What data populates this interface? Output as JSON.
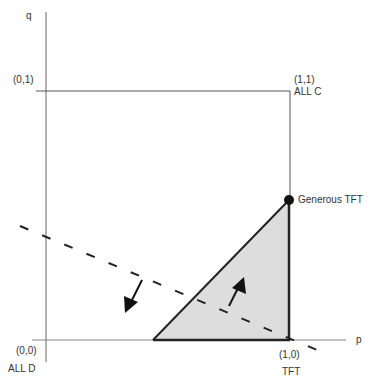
{
  "diagram": {
    "axes": {
      "x_label": "p",
      "y_label": "q"
    },
    "corners": {
      "origin": {
        "coord": "(0,0)",
        "name": "ALL D"
      },
      "top_left": {
        "coord": "(0,1)"
      },
      "top_right": {
        "coord": "(1,1)",
        "name": "ALL C"
      },
      "bottom_right": {
        "coord": "(1,0)",
        "name": "TFT"
      }
    },
    "point": {
      "name": "Generous TFT"
    },
    "region": {
      "fill": "#dddddd",
      "stroke": "#222222"
    },
    "dashed_line": {
      "color": "#222222"
    },
    "arrows": [
      {
        "direction": "down-left",
        "side": "outside region"
      },
      {
        "direction": "up-right",
        "side": "inside region"
      }
    ]
  }
}
